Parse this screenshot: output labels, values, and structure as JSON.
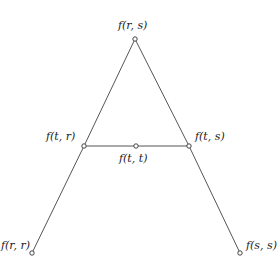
{
  "diagram": {
    "line_color": "#555555",
    "nodes": [
      {
        "id": "frs",
        "label": "f(r, s)",
        "x": 135,
        "y": 39
      },
      {
        "id": "ftr",
        "label": "f(t, r)",
        "x": 84,
        "y": 146
      },
      {
        "id": "ftt",
        "label": "f(t, t)",
        "x": 136,
        "y": 146
      },
      {
        "id": "fts",
        "label": "f(t, s)",
        "x": 189,
        "y": 146
      },
      {
        "id": "frr",
        "label": "f(r, r)",
        "x": 32,
        "y": 253
      },
      {
        "id": "fss",
        "label": "f(s, s)",
        "x": 240,
        "y": 253
      }
    ],
    "edges": [
      [
        "frs",
        "ftr"
      ],
      [
        "ftr",
        "frr"
      ],
      [
        "frs",
        "fts"
      ],
      [
        "fts",
        "fss"
      ],
      [
        "ftr",
        "ftt"
      ],
      [
        "ftt",
        "fts"
      ]
    ]
  }
}
